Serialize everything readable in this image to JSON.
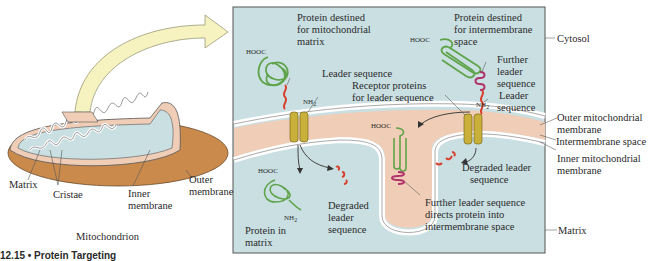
{
  "figure": {
    "caption": "12.15 • Protein Targeting",
    "colors": {
      "cytosol": "#c9dfe2",
      "intermembrane": "#f0cdb6",
      "membrane": "#ffffff",
      "outer_mito": "#c98a4c",
      "receptor": "#c9b03a",
      "protein_green": "#5fa34a",
      "leader_red": "#d8402e",
      "further_leader_magenta": "#b0306a",
      "arrow_yellow": "#f6f3c0"
    }
  },
  "overview": {
    "title": "Mitochondrion",
    "labels": {
      "matrix": "Matrix",
      "cristae": "Cristae",
      "inner_membrane_1": "Inner",
      "inner_membrane_2": "membrane",
      "outer_membrane_1": "Outer",
      "outer_membrane_2": "membrane"
    }
  },
  "detail": {
    "protein_matrix_title": [
      "Protein destined",
      "for mitochondrial",
      "matrix"
    ],
    "protein_ims_title": [
      "Protein destined",
      "for intermembrane",
      "space"
    ],
    "hooc": "HOOC",
    "nh2": "NH",
    "nh2_sub": "2",
    "leader_sequence": "Leader sequence",
    "receptor_proteins": [
      "Receptor proteins",
      "for leader sequence"
    ],
    "further_leader": [
      "Further",
      "leader",
      "sequence"
    ],
    "leader_seq_right": [
      "Leader",
      "sequence"
    ],
    "degraded_left": [
      "Degraded",
      "leader",
      "sequence"
    ],
    "degraded_right": [
      "Degraded leader",
      "sequence"
    ],
    "protein_in_matrix": [
      "Protein in",
      "matrix"
    ],
    "further_directs": [
      "Further leader sequence",
      "directs protein into",
      "intermembrane space"
    ]
  },
  "side_labels": {
    "cytosol": "Cytosol",
    "outer_mito_membrane": [
      "Outer mitochondrial",
      "membrane"
    ],
    "intermembrane_space": "Intermembrane space",
    "inner_mito_membrane": [
      "Inner mitochondrial",
      "membrane"
    ],
    "matrix": "Matrix"
  }
}
